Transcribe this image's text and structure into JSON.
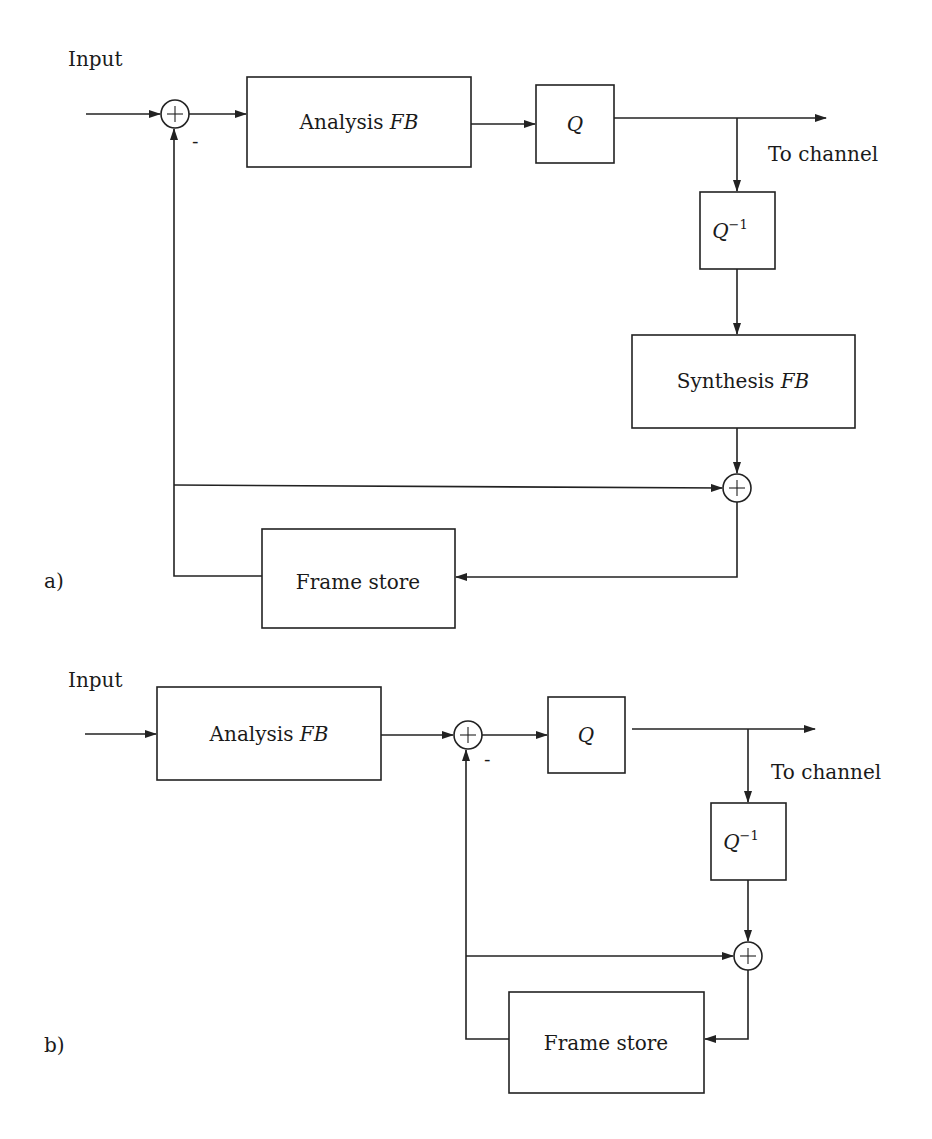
{
  "diagram_a": {
    "panel_label": "a)",
    "input_label": "Input",
    "analysis": {
      "text": "Analysis ",
      "math": "FB"
    },
    "quantizer": {
      "math": "Q"
    },
    "inverse_quantizer": {
      "math": "Q",
      "sup": "−1"
    },
    "synthesis": {
      "text": "Synthesis ",
      "math": "FB"
    },
    "frame_store": {
      "text": "Frame store"
    },
    "output_label": "To channel",
    "subtract_sign": "-"
  },
  "diagram_b": {
    "panel_label": "b)",
    "input_label": "Input",
    "analysis": {
      "text": "Analysis ",
      "math": "FB"
    },
    "quantizer": {
      "math": "Q"
    },
    "inverse_quantizer": {
      "math": "Q",
      "sup": "−1"
    },
    "frame_store": {
      "text": "Frame store"
    },
    "output_label": "To channel",
    "subtract_sign": "-"
  }
}
